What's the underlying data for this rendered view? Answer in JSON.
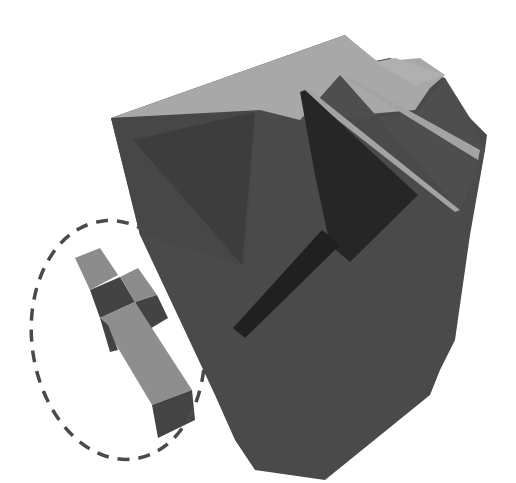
{
  "figure": {
    "colors": {
      "background": "#ffffff",
      "top_face": "#a9a9a9",
      "front_face": "#4b4b4b",
      "front_face_inner": "#424242",
      "dark_recess": "#2a2a2a",
      "slit": "#222222",
      "small_part_light": "#8e8e8e",
      "small_part_dark": "#454545",
      "highlight_ellipse": "#4a4a4a"
    },
    "highlight": {
      "shape": "dashed-ellipse",
      "center": [
        118,
        340
      ],
      "radii": [
        86,
        120
      ]
    }
  }
}
